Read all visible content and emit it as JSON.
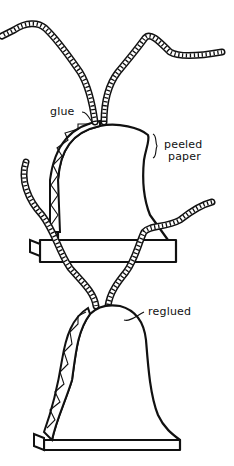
{
  "diagram": {
    "labels": {
      "glue": "glue",
      "peeled_line1": "peeled",
      "peeled_line2": "paper",
      "reglued": "reglued"
    },
    "figures": [
      {
        "name": "upper-bell",
        "state": "peeled paper",
        "ropes": 4
      },
      {
        "name": "lower-bell",
        "state": "reglued",
        "ropes": 2
      }
    ],
    "colors": {
      "ink": "#111111",
      "background": "#ffffff"
    }
  }
}
